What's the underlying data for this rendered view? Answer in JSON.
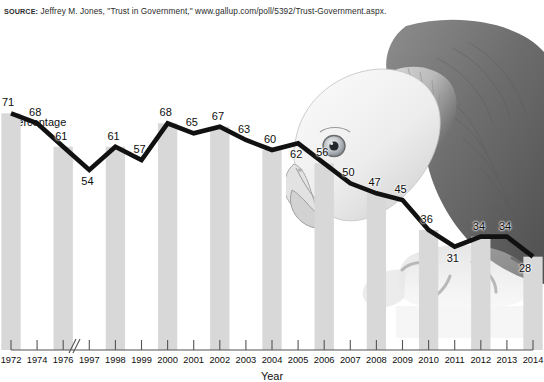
{
  "source": {
    "label": "SOURCE:",
    "text": "Jeffrey M. Jones, \"Trust in Government,\" www.gallup.com/poll/5392/Trust-Government.aspx."
  },
  "colors": {
    "line": "#111111",
    "bar": "#d8d8d8",
    "axis": "#555555",
    "text": "#0d0d0d",
    "background": "#ffffff"
  },
  "image": {
    "eagle_alt": "bald eagle biting the trend line"
  },
  "chart_data": {
    "type": "line",
    "title": "",
    "subtitle": "",
    "xlabel": "Year",
    "ylabel": "Percentage",
    "grid": false,
    "legend": "none",
    "axis_break_after": "1976",
    "ylim": [
      0,
      75
    ],
    "categories": [
      "1972",
      "1974",
      "1976",
      "1997",
      "1998",
      "1999",
      "2000",
      "2001",
      "2002",
      "2003",
      "2004",
      "2005",
      "2006",
      "2007",
      "2008",
      "2009",
      "2010",
      "2011",
      "2012",
      "2013",
      "2014"
    ],
    "values": [
      71,
      68,
      61,
      54,
      61,
      57,
      68,
      65,
      67,
      63,
      60,
      62,
      56,
      50,
      47,
      45,
      36,
      31,
      34,
      34,
      28
    ],
    "bar_categories": [
      "1972",
      "1976",
      "1998",
      "2000",
      "2002",
      "2004",
      "2006",
      "2008",
      "2010",
      "2012",
      "2014"
    ],
    "data_labels": [
      "71",
      "68",
      "61",
      "54",
      "61",
      "57",
      "68",
      "65",
      "67",
      "63",
      "60",
      "62",
      "56",
      "50",
      "47",
      "45",
      "36",
      "31",
      "34",
      "34",
      "28"
    ]
  }
}
